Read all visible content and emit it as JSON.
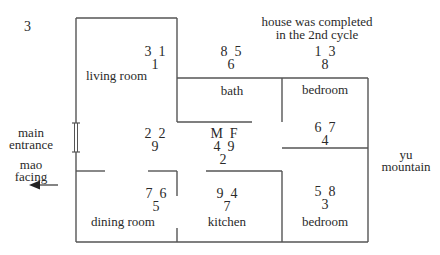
{
  "figure_number": "3",
  "note": {
    "line1": "house was completed",
    "line2": "in the 2nd cycle"
  },
  "rooms": {
    "living_room": {
      "label": "living room",
      "stars": {
        "mountain": "3",
        "water": "1",
        "base": "1"
      }
    },
    "bath": {
      "label": "bath",
      "stars": {
        "mountain": "8",
        "water": "5",
        "base": "6"
      }
    },
    "bedroom_north": {
      "label": "bedroom",
      "stars": {
        "mountain": "1",
        "water": "3",
        "base": "8"
      }
    },
    "hall": {
      "stars": {
        "mountain": "2",
        "water": "2",
        "base": "9"
      }
    },
    "center": {
      "stars": {
        "mountain": "4",
        "water": "9",
        "base": "2"
      },
      "m_label": "M",
      "f_label": "F"
    },
    "bedroom_east": {
      "stars": {
        "mountain": "6",
        "water": "7",
        "base": "4"
      }
    },
    "dining_room": {
      "label": "dining room",
      "stars": {
        "mountain": "7",
        "water": "6",
        "base": "5"
      }
    },
    "kitchen": {
      "label": "kitchen",
      "stars": {
        "mountain": "9",
        "water": "4",
        "base": "7"
      }
    },
    "bedroom_south": {
      "label": "bedroom",
      "stars": {
        "mountain": "5",
        "water": "8",
        "base": "3"
      }
    }
  },
  "annotations": {
    "entrance_line1": "main",
    "entrance_line2": "entrance",
    "facing_line1": "mao",
    "facing_line2": "facing",
    "sitting_line1": "yu",
    "sitting_line2": "mountain"
  },
  "colors": {
    "line": "#555555",
    "text": "#2a2a2a"
  }
}
